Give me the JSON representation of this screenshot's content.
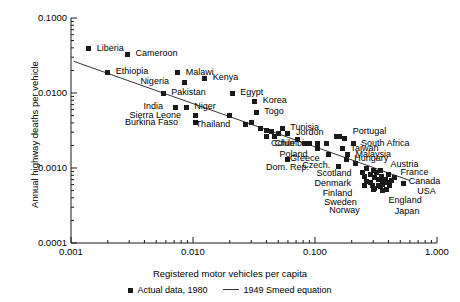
{
  "chart_data": {
    "type": "scatter",
    "title": "",
    "xlabel": "Registered motor vehicles per capita",
    "ylabel": "Annual highway deaths per vehicle",
    "xscale": "log",
    "yscale": "log",
    "xlim": [
      0.001,
      1.0
    ],
    "ylim": [
      0.0001,
      0.1
    ],
    "xticks": [
      "0.001",
      "0.010",
      "0.100",
      "1.000"
    ],
    "yticks": [
      "0.1000",
      "0.0100",
      "0.0010",
      "0.0001"
    ],
    "grid": false,
    "legend_position": "bottom-center",
    "legend": [
      {
        "label": "Actual data, 1980",
        "marker": "square"
      },
      {
        "label": "1949 Smeed equation",
        "marker": "line"
      }
    ],
    "series": [
      {
        "name": "Actual data, 1980",
        "points": [
          {
            "label": "Liberia",
            "x": 0.0014,
            "y": 0.039,
            "lx": 8,
            "ly": -4
          },
          {
            "label": "Cameroon",
            "x": 0.0029,
            "y": 0.033,
            "lx": 8,
            "ly": -4
          },
          {
            "label": "Ethiopia",
            "x": 0.002,
            "y": 0.019,
            "lx": 8,
            "ly": -4
          },
          {
            "label": "Malawi",
            "x": 0.0075,
            "y": 0.0185,
            "lx": 8,
            "ly": -4
          },
          {
            "label": "Kenya",
            "x": 0.0125,
            "y": 0.0158,
            "lx": 8,
            "ly": -4
          },
          {
            "label": "Nigeria",
            "x": 0.0085,
            "y": 0.014,
            "lx": -44,
            "ly": -4
          },
          {
            "label": "Egypt",
            "x": 0.021,
            "y": 0.01,
            "lx": 8,
            "ly": -4
          },
          {
            "label": "Pakistan",
            "x": 0.0057,
            "y": 0.01,
            "lx": 8,
            "ly": -4
          },
          {
            "label": "Korea",
            "x": 0.032,
            "y": 0.0078,
            "lx": 8,
            "ly": -4
          },
          {
            "label": "India",
            "x": 0.0072,
            "y": 0.0065,
            "lx": -32,
            "ly": -4
          },
          {
            "label": "Niger",
            "x": 0.0088,
            "y": 0.0065,
            "lx": 8,
            "ly": -4
          },
          {
            "label": "Togo",
            "x": 0.033,
            "y": 0.0055,
            "lx": 8,
            "ly": -4
          },
          {
            "label": "Sierra Leone",
            "x": 0.0105,
            "y": 0.005,
            "lx": -66,
            "ly": -4
          },
          {
            "label": "Burkina Faso",
            "x": 0.0104,
            "y": 0.004,
            "lx": -70,
            "ly": -4
          },
          {
            "label": "Thailand",
            "x": 0.027,
            "y": 0.0038,
            "lx": -50,
            "ly": -4
          },
          {
            "label": "Tunisia",
            "x": 0.054,
            "y": 0.0034,
            "lx": 8,
            "ly": -4
          },
          {
            "label": "Jordon",
            "x": 0.06,
            "y": 0.0029,
            "lx": 8,
            "ly": -4
          },
          {
            "label": "Columbia",
            "x": 0.047,
            "y": 0.0026,
            "lx": -4,
            "ly": 3
          },
          {
            "label": "Chile",
            "x": 0.082,
            "y": 0.0021,
            "lx": -30,
            "ly": -4
          },
          {
            "label": "Poland",
            "x": 0.105,
            "y": 0.0018,
            "lx": -38,
            "ly": 2
          },
          {
            "label": "Dom. Rep.",
            "x": 0.06,
            "y": 0.0013,
            "lx": -22,
            "ly": 5
          },
          {
            "label": "Portugal",
            "x": 0.175,
            "y": 0.0025,
            "lx": 8,
            "ly": -10
          },
          {
            "label": "South Africa",
            "x": 0.205,
            "y": 0.0021,
            "lx": 8,
            "ly": -4
          },
          {
            "label": "Taiwan",
            "x": 0.168,
            "y": 0.0018,
            "lx": 8,
            "ly": -4
          },
          {
            "label": "Greece",
            "x": 0.128,
            "y": 0.0015,
            "lx": -38,
            "ly": 0
          },
          {
            "label": "Malaysia",
            "x": 0.185,
            "y": 0.0015,
            "lx": 8,
            "ly": -4
          },
          {
            "label": "Hungary",
            "x": 0.18,
            "y": 0.0013,
            "lx": 8,
            "ly": -4
          },
          {
            "label": "Czech.",
            "x": 0.155,
            "y": 0.00105,
            "lx": -36,
            "ly": -4
          },
          {
            "label": "Austria",
            "x": 0.345,
            "y": 0.00092,
            "lx": 10,
            "ly": -10
          },
          {
            "label": "France",
            "x": 0.4,
            "y": 0.00082,
            "lx": 12,
            "ly": -5
          },
          {
            "label": "Canada",
            "x": 0.45,
            "y": 0.00074,
            "lx": 14,
            "ly": 0
          },
          {
            "label": "USA",
            "x": 0.53,
            "y": 0.00063,
            "lx": 14,
            "ly": 5
          },
          {
            "label": "Scotland",
            "x": 0.245,
            "y": 0.00088,
            "lx": -46,
            "ly": -2
          },
          {
            "label": "Denmark",
            "x": 0.255,
            "y": 0.00076,
            "lx": -50,
            "ly": 3
          },
          {
            "label": "Finland",
            "x": 0.265,
            "y": 0.00066,
            "lx": -44,
            "ly": 8
          },
          {
            "label": "Sweden",
            "x": 0.295,
            "y": 0.00058,
            "lx": -48,
            "ly": 13
          },
          {
            "label": "Norway",
            "x": 0.3,
            "y": 0.00052,
            "lx": -44,
            "ly": 18
          },
          {
            "label": "England",
            "x": 0.345,
            "y": 0.00056,
            "lx": 8,
            "ly": 10
          },
          {
            "label": "Japan",
            "x": 0.36,
            "y": 0.0005,
            "lx": 12,
            "ly": 17
          },
          {
            "label": "",
            "x": 0.036,
            "y": 0.0034,
            "lx": 0,
            "ly": 0
          },
          {
            "label": "",
            "x": 0.04,
            "y": 0.0032,
            "lx": 0,
            "ly": 0
          },
          {
            "label": "",
            "x": 0.044,
            "y": 0.0031,
            "lx": 0,
            "ly": 0
          },
          {
            "label": "",
            "x": 0.05,
            "y": 0.0029,
            "lx": 0,
            "ly": 0
          },
          {
            "label": "",
            "x": 0.04,
            "y": 0.0026,
            "lx": 0,
            "ly": 0
          },
          {
            "label": "",
            "x": 0.09,
            "y": 0.0021,
            "lx": 0,
            "ly": 0
          },
          {
            "label": "",
            "x": 0.105,
            "y": 0.0021,
            "lx": 0,
            "ly": 0
          },
          {
            "label": "",
            "x": 0.15,
            "y": 0.0026,
            "lx": 0,
            "ly": 0
          },
          {
            "label": "",
            "x": 0.16,
            "y": 0.0026,
            "lx": 0,
            "ly": 0
          },
          {
            "label": "",
            "x": 0.125,
            "y": 0.0021,
            "lx": 0,
            "ly": 0
          },
          {
            "label": "",
            "x": 0.215,
            "y": 0.00115,
            "lx": 0,
            "ly": 0
          },
          {
            "label": "",
            "x": 0.265,
            "y": 0.00098,
            "lx": 0,
            "ly": 0
          },
          {
            "label": "",
            "x": 0.3,
            "y": 0.00092,
            "lx": 0,
            "ly": 0
          },
          {
            "label": "",
            "x": 0.32,
            "y": 0.00086,
            "lx": 0,
            "ly": 0
          },
          {
            "label": "",
            "x": 0.31,
            "y": 0.00074,
            "lx": 0,
            "ly": 0
          },
          {
            "label": "",
            "x": 0.33,
            "y": 0.0007,
            "lx": 0,
            "ly": 0
          },
          {
            "label": "",
            "x": 0.35,
            "y": 0.00078,
            "lx": 0,
            "ly": 0
          },
          {
            "label": "",
            "x": 0.375,
            "y": 0.0007,
            "lx": 0,
            "ly": 0
          },
          {
            "label": "",
            "x": 0.39,
            "y": 0.00064,
            "lx": 0,
            "ly": 0
          },
          {
            "label": "",
            "x": 0.36,
            "y": 0.0006,
            "lx": 0,
            "ly": 0
          },
          {
            "label": "",
            "x": 0.33,
            "y": 0.00058,
            "lx": 0,
            "ly": 0
          },
          {
            "label": "",
            "x": 0.31,
            "y": 0.00054,
            "lx": 0,
            "ly": 0
          },
          {
            "label": "",
            "x": 0.405,
            "y": 0.00058,
            "lx": 0,
            "ly": 0
          },
          {
            "label": "",
            "x": 0.42,
            "y": 0.00068,
            "lx": 0,
            "ly": 0
          },
          {
            "label": "",
            "x": 0.285,
            "y": 0.00064,
            "lx": 0,
            "ly": 0
          },
          {
            "label": "",
            "x": 0.285,
            "y": 0.00082,
            "lx": 0,
            "ly": 0
          },
          {
            "label": "",
            "x": 0.255,
            "y": 0.00058,
            "lx": 0,
            "ly": 0
          },
          {
            "label": "",
            "x": 0.385,
            "y": 0.00052,
            "lx": 0,
            "ly": 0
          },
          {
            "label": "",
            "x": 0.355,
            "y": 0.00066,
            "lx": 0,
            "ly": 0
          },
          {
            "label": "",
            "x": 0.072,
            "y": 0.0024,
            "lx": 0,
            "ly": 0
          },
          {
            "label": "",
            "x": 0.02,
            "y": 0.005,
            "lx": 0,
            "ly": 0
          },
          {
            "label": "",
            "x": 0.03,
            "y": 0.004,
            "lx": 0,
            "ly": 0
          }
        ]
      },
      {
        "name": "1949 Smeed equation",
        "type": "line",
        "points": [
          {
            "x": 0.00105,
            "y": 0.0265
          },
          {
            "x": 0.6,
            "y": 0.00068
          }
        ]
      }
    ]
  }
}
